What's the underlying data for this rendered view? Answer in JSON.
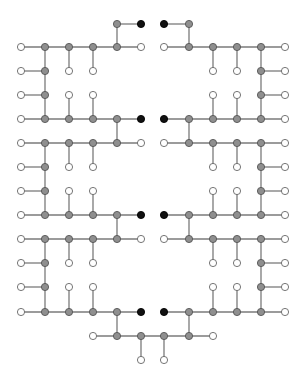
{
  "diagram": {
    "type": "graph",
    "colors": {
      "background": "#ffffff",
      "edge": "#7a7a7a",
      "gray": "#8f8f8f",
      "white": "#ffffff",
      "black": "#111111"
    },
    "node_radius": 3.6,
    "columns_left": [
      21,
      45,
      69,
      93,
      117,
      141
    ],
    "columns_right": [
      164,
      189,
      213,
      237,
      261,
      285
    ],
    "rows": [
      24,
      47,
      71,
      95,
      119,
      143,
      167,
      191,
      215,
      239,
      263,
      287,
      312,
      336,
      360
    ]
  }
}
